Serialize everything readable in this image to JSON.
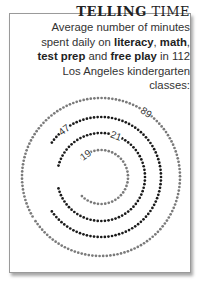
{
  "header": {
    "title_bold": "TELLING",
    "title_light": "TIME",
    "subtitle_parts": {
      "p1": "Average number of minutes spent daily on ",
      "literacy": "literacy",
      "c1": ", ",
      "math": "math",
      "c2": ", ",
      "test_prep": "test prep",
      "p2": " and ",
      "free_play": "free play",
      "p3": " in 112 Los Angeles kindergarten classes:"
    }
  },
  "colors": {
    "gray": "#7a7a7a",
    "black": "#1a1a1a",
    "border": "#9a9a9a"
  },
  "chart_data": {
    "type": "radial-dot-arc",
    "title": "TELLING TIME",
    "subtitle": "Average number of minutes spent daily on literacy, math, test prep and free play in 112 Los Angeles kindergarten classes",
    "unit": "minutes per day",
    "categories": [
      "literacy",
      "math",
      "test prep",
      "free play"
    ],
    "values": [
      89,
      47,
      21,
      19
    ],
    "series": [
      {
        "name": "literacy",
        "value": 89,
        "color": "#7a7a7a",
        "radius": 79,
        "start_deg": 150,
        "sweep_deg": 356,
        "label_angle": 55
      },
      {
        "name": "math",
        "value": 47,
        "color": "#1a1a1a",
        "radius": 60,
        "start_deg": 215,
        "sweep_deg": 290,
        "label_angle": 128
      },
      {
        "name": "test prep",
        "value": 21,
        "color": "#1a1a1a",
        "radius": 44,
        "start_deg": 195,
        "sweep_deg": 330,
        "label_angle": 70
      },
      {
        "name": "free play",
        "value": 19,
        "color": "#7a7a7a",
        "radius": 27,
        "start_deg": 225,
        "sweep_deg": 270,
        "label_angle": 125
      }
    ],
    "center": [
      101,
      177
    ]
  }
}
